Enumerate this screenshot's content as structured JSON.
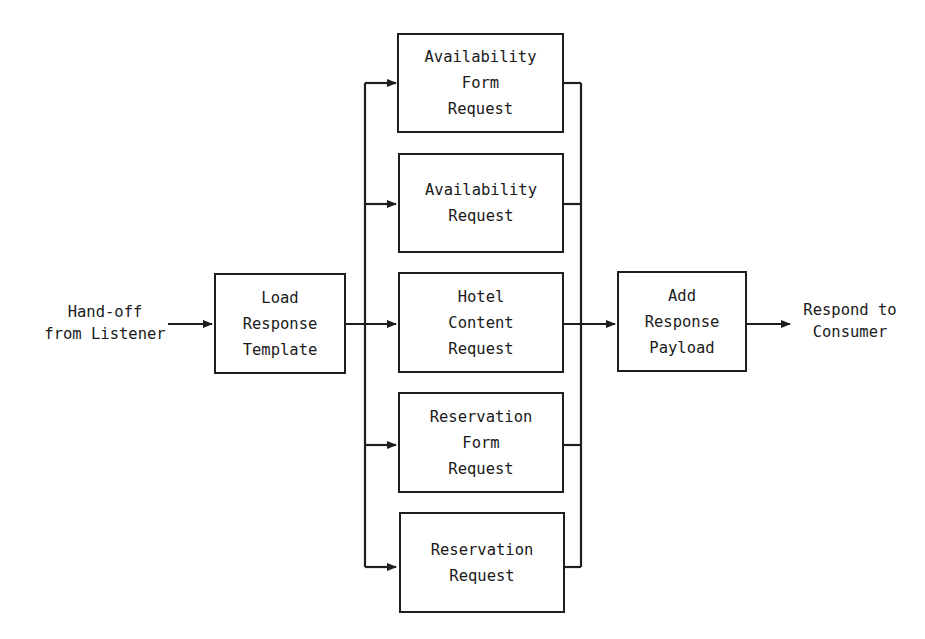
{
  "diagram": {
    "type": "flowchart",
    "input": {
      "lines": [
        "Hand-off",
        "from Listener"
      ]
    },
    "load_step": {
      "lines": [
        "Load",
        "Response",
        "Template"
      ]
    },
    "parallel_requests": [
      {
        "lines": [
          "Availability",
          "Form",
          "Request"
        ]
      },
      {
        "lines": [
          "Availability",
          "Request"
        ]
      },
      {
        "lines": [
          "Hotel",
          "Content",
          "Request"
        ]
      },
      {
        "lines": [
          "Reservation",
          "Form",
          "Request"
        ]
      },
      {
        "lines": [
          "Reservation",
          "Request"
        ]
      }
    ],
    "add_step": {
      "lines": [
        "Add",
        "Response",
        "Payload"
      ]
    },
    "output": {
      "lines": [
        "Respond to",
        "Consumer"
      ]
    },
    "edges": [
      {
        "from": "Hand-off from Listener",
        "to": "Load Response Template"
      },
      {
        "from": "Load Response Template",
        "to": "Availability Form Request"
      },
      {
        "from": "Load Response Template",
        "to": "Availability Request"
      },
      {
        "from": "Load Response Template",
        "to": "Hotel Content Request"
      },
      {
        "from": "Load Response Template",
        "to": "Reservation Form Request"
      },
      {
        "from": "Load Response Template",
        "to": "Reservation Request"
      },
      {
        "from": "Availability Form Request",
        "to": "Add Response Payload"
      },
      {
        "from": "Availability Request",
        "to": "Add Response Payload"
      },
      {
        "from": "Hotel Content Request",
        "to": "Add Response Payload"
      },
      {
        "from": "Reservation Form Request",
        "to": "Add Response Payload"
      },
      {
        "from": "Reservation Request",
        "to": "Add Response Payload"
      },
      {
        "from": "Add Response Payload",
        "to": "Respond to Consumer"
      }
    ],
    "colors": {
      "stroke": "#1e1e1e",
      "background": "#ffffff",
      "text": "#1a1a1a"
    }
  }
}
